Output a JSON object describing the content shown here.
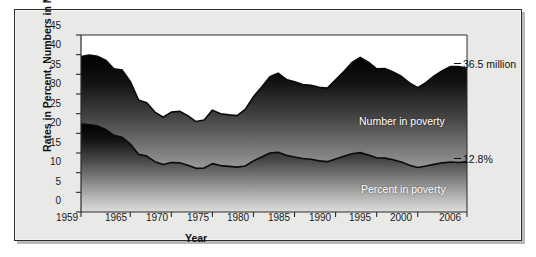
{
  "chart_data": {
    "type": "area",
    "title": "",
    "xlabel": "Year",
    "ylabel": "Rates in Percent, Numbers in Millions",
    "xlim": [
      1959,
      2006
    ],
    "ylim": [
      0,
      45
    ],
    "grid": false,
    "legend_position": "inside-right",
    "y_ticks": [
      45,
      40,
      35,
      30,
      25,
      20,
      15,
      10,
      5,
      0
    ],
    "x_ticks": [
      1959,
      1965,
      1970,
      1975,
      1980,
      1985,
      1990,
      1995,
      2000,
      2006
    ],
    "annotations": [
      {
        "text": "36.5 million",
        "series": "Number in poverty",
        "year": 2006,
        "value": 36.5
      },
      {
        "text": "12.8%",
        "series": "Percent in poverty",
        "year": 2006,
        "value": 12.8
      }
    ],
    "series": [
      {
        "name": "Number in poverty",
        "unit": "millions",
        "x": [
          1959,
          1960,
          1961,
          1962,
          1963,
          1964,
          1965,
          1966,
          1967,
          1968,
          1969,
          1970,
          1971,
          1972,
          1973,
          1974,
          1975,
          1976,
          1977,
          1978,
          1979,
          1980,
          1981,
          1982,
          1983,
          1984,
          1985,
          1986,
          1987,
          1988,
          1989,
          1990,
          1991,
          1992,
          1993,
          1994,
          1995,
          1996,
          1997,
          1998,
          1999,
          2000,
          2001,
          2002,
          2003,
          2004,
          2005,
          2006
        ],
        "values": [
          39.5,
          39.9,
          39.6,
          38.6,
          36.4,
          36.1,
          33.2,
          28.5,
          27.8,
          25.4,
          24.1,
          25.4,
          25.6,
          24.5,
          23.0,
          23.4,
          25.9,
          25.0,
          24.7,
          24.5,
          26.1,
          29.3,
          31.8,
          34.4,
          35.3,
          33.7,
          33.1,
          32.4,
          32.2,
          31.7,
          31.5,
          33.6,
          35.7,
          38.0,
          39.3,
          38.1,
          36.4,
          36.5,
          35.6,
          34.5,
          32.8,
          31.6,
          32.9,
          34.6,
          35.9,
          37.0,
          37.0,
          36.5
        ]
      },
      {
        "name": "Percent in poverty",
        "unit": "percent",
        "x": [
          1959,
          1960,
          1961,
          1962,
          1963,
          1964,
          1965,
          1966,
          1967,
          1968,
          1969,
          1970,
          1971,
          1972,
          1973,
          1974,
          1975,
          1976,
          1977,
          1978,
          1979,
          1980,
          1981,
          1982,
          1983,
          1984,
          1985,
          1986,
          1987,
          1988,
          1989,
          1990,
          1991,
          1992,
          1993,
          1994,
          1995,
          1996,
          1997,
          1998,
          1999,
          2000,
          2001,
          2002,
          2003,
          2004,
          2005,
          2006
        ],
        "values": [
          22.4,
          22.2,
          21.9,
          21.0,
          19.5,
          19.0,
          17.3,
          14.7,
          14.2,
          12.8,
          12.1,
          12.6,
          12.5,
          11.9,
          11.1,
          11.2,
          12.3,
          11.8,
          11.6,
          11.4,
          11.7,
          13.0,
          14.0,
          15.0,
          15.2,
          14.4,
          14.0,
          13.6,
          13.4,
          13.0,
          12.8,
          13.5,
          14.2,
          14.8,
          15.1,
          14.5,
          13.8,
          13.7,
          13.3,
          12.7,
          11.9,
          11.3,
          11.7,
          12.1,
          12.5,
          12.7,
          12.6,
          12.8
        ]
      }
    ]
  },
  "series_labels": {
    "number": "Number in poverty",
    "percent": "Percent in poverty"
  },
  "colors": {
    "fill_top": "#000000",
    "fill_bottom": "#d8d8d6",
    "stroke": "#111111",
    "panel_background": "#e9e9e7",
    "plot_background": "#ffffff",
    "text": "#111111"
  }
}
